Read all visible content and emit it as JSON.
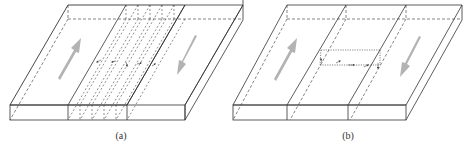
{
  "panels": [
    {
      "id": "a",
      "label": "(a)",
      "description": "Slab with broad fault zone of multiple parallel dashed planes; two opposing shear arrows",
      "arrow_color": "#b3b3b3",
      "fault_planes": 5
    },
    {
      "id": "b",
      "label": "(b)",
      "description": "Slab with narrow fault zone containing a dotted rectangular sub-region with small displacement arrows; two opposing shear arrows",
      "arrow_color": "#b3b3b3"
    }
  ],
  "colors": {
    "line": "#333333",
    "arrow": "#b3b3b3",
    "background": "#ffffff"
  }
}
